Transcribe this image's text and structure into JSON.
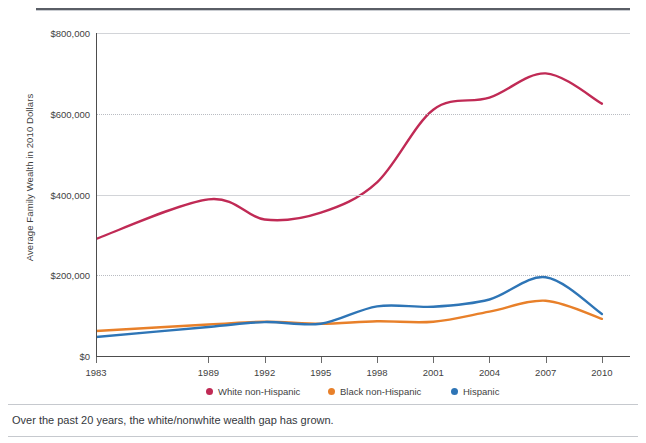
{
  "caption": "Over the past 20 years, the white/nonwhite wealth gap has grown.",
  "axis": {
    "y_title": "Average Family Wealth in 2010 Dollars"
  },
  "legend": [
    {
      "label": "White non-Hispanic",
      "color": "#c02a55"
    },
    {
      "label": "Black non-Hispanic",
      "color": "#e8802a"
    },
    {
      "label": "Hispanic",
      "color": "#2e75b6"
    }
  ],
  "chart_data": {
    "type": "line",
    "title": "",
    "xlabel": "",
    "ylabel": "Average Family Wealth in 2010 Dollars",
    "xlim": [
      1983,
      2011.5
    ],
    "ylim": [
      0,
      800000
    ],
    "grid": true,
    "legend_position": "bottom",
    "xticks": [
      1983,
      1989,
      1992,
      1995,
      1998,
      2001,
      2004,
      2007,
      2010
    ],
    "xtick_labels": [
      "1983",
      "1989",
      "1992",
      "1995",
      "1998",
      "2001",
      "2004",
      "2007",
      "2010"
    ],
    "yticks": [
      0,
      200000,
      400000,
      600000,
      800000
    ],
    "ytick_labels": [
      "$0",
      "$200,000",
      "$400,000",
      "$600,000",
      "$800,000"
    ],
    "x": [
      1983,
      1989,
      1992,
      1995,
      1998,
      2001,
      2004,
      2007,
      2010
    ],
    "series": [
      {
        "name": "White non-Hispanic",
        "color": "#c02a55",
        "values": [
          290000,
          388000,
          338000,
          355000,
          430000,
          610000,
          640000,
          700000,
          625000
        ]
      },
      {
        "name": "Black non-Hispanic",
        "color": "#e8802a",
        "values": [
          62000,
          78000,
          85000,
          80000,
          86000,
          85000,
          110000,
          137000,
          92000
        ]
      },
      {
        "name": "Hispanic",
        "color": "#2e75b6",
        "values": [
          47000,
          72000,
          84000,
          80000,
          123000,
          122000,
          140000,
          195000,
          104000
        ]
      }
    ]
  }
}
